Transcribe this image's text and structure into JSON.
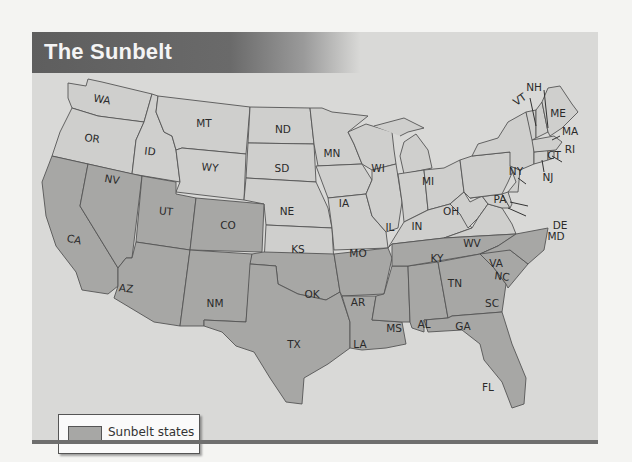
{
  "title": "The Sunbelt",
  "legend": {
    "label": "Sunbelt states",
    "swatch_color": "#a7a7a5"
  },
  "colors": {
    "sunbelt_fill": "#a7a7a5",
    "other_fill": "#cfcfcd",
    "background": "#d9d9d7",
    "header": "#5e5e5e"
  },
  "states": {
    "WA": "WA",
    "OR": "OR",
    "CA": "CA",
    "NV": "NV",
    "ID": "ID",
    "MT": "MT",
    "WY": "WY",
    "UT": "UT",
    "AZ": "AZ",
    "CO": "CO",
    "NM": "NM",
    "ND": "ND",
    "SD": "SD",
    "NE": "NE",
    "KS": "KS",
    "OK": "OK",
    "TX": "TX",
    "MN": "MN",
    "IA": "IA",
    "MO": "MO",
    "AR": "AR",
    "LA": "LA",
    "WI": "WI",
    "IL": "IL",
    "MI": "MI",
    "IN": "IN",
    "OH": "OH",
    "KY": "KY",
    "TN": "TN",
    "MS": "MS",
    "AL": "AL",
    "GA": "GA",
    "FL": "FL",
    "SC": "SC",
    "NC": "NC",
    "VA": "VA",
    "WV": "WV",
    "PA": "PA",
    "NY": "NY",
    "VT": "VT",
    "NH": "NH",
    "ME": "ME",
    "MA": "MA",
    "RI": "RI",
    "CT": "CT",
    "NJ": "NJ",
    "DE": "DE",
    "MD": "MD"
  },
  "sunbelt_states": [
    "CA",
    "NV",
    "UT",
    "AZ",
    "CO",
    "NM",
    "TX",
    "OK",
    "AR",
    "LA",
    "MS",
    "AL",
    "TN",
    "GA",
    "FL",
    "SC",
    "NC"
  ]
}
